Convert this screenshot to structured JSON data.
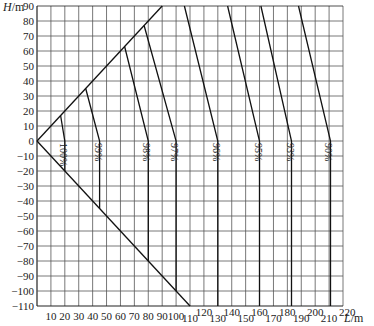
{
  "chart_data": {
    "type": "line",
    "title": "",
    "xlabel": "L/m",
    "ylabel": "H/m",
    "xlim": [
      0,
      220
    ],
    "ylim": [
      -110,
      90
    ],
    "grid": true,
    "x_ticks": [
      10,
      20,
      30,
      40,
      50,
      60,
      70,
      80,
      90,
      100,
      110,
      120,
      130,
      140,
      150,
      160,
      170,
      180,
      190,
      200,
      210,
      220
    ],
    "y_ticks": [
      90,
      80,
      70,
      60,
      50,
      40,
      30,
      20,
      10,
      0,
      -10,
      -20,
      -30,
      -40,
      -50,
      -60,
      -70,
      -80,
      -90,
      -100,
      -110
    ],
    "boundary": {
      "upper": [
        [
          0,
          0
        ],
        [
          90,
          90
        ]
      ],
      "lower": [
        [
          0,
          0
        ],
        [
          110,
          -110
        ]
      ]
    },
    "series": [
      {
        "name": "100%",
        "points": [
          [
            17,
            17
          ],
          [
            20,
            0
          ],
          [
            20,
            -20
          ]
        ]
      },
      {
        "name": "99%",
        "points": [
          [
            35,
            35
          ],
          [
            45,
            0
          ],
          [
            45,
            -45
          ]
        ]
      },
      {
        "name": "98%",
        "points": [
          [
            63,
            63
          ],
          [
            80,
            0
          ],
          [
            80,
            -80
          ]
        ]
      },
      {
        "name": "97%",
        "points": [
          [
            77,
            77
          ],
          [
            100,
            0
          ],
          [
            100,
            -100
          ]
        ]
      },
      {
        "name": "96%",
        "points": [
          [
            106,
            90
          ],
          [
            130,
            0
          ],
          [
            130,
            -110
          ]
        ]
      },
      {
        "name": "95%",
        "points": [
          [
            137,
            90
          ],
          [
            160,
            0
          ],
          [
            160,
            -110
          ]
        ]
      },
      {
        "name": "93%",
        "points": [
          [
            161,
            90
          ],
          [
            183,
            0
          ],
          [
            183,
            -110
          ]
        ]
      },
      {
        "name": "90%",
        "points": [
          [
            188,
            90
          ],
          [
            211,
            0
          ],
          [
            211,
            -110
          ]
        ]
      }
    ]
  },
  "labels": {
    "y_axis": "H",
    "y_unit": "/m",
    "x_axis": "L",
    "x_unit": "/m"
  }
}
